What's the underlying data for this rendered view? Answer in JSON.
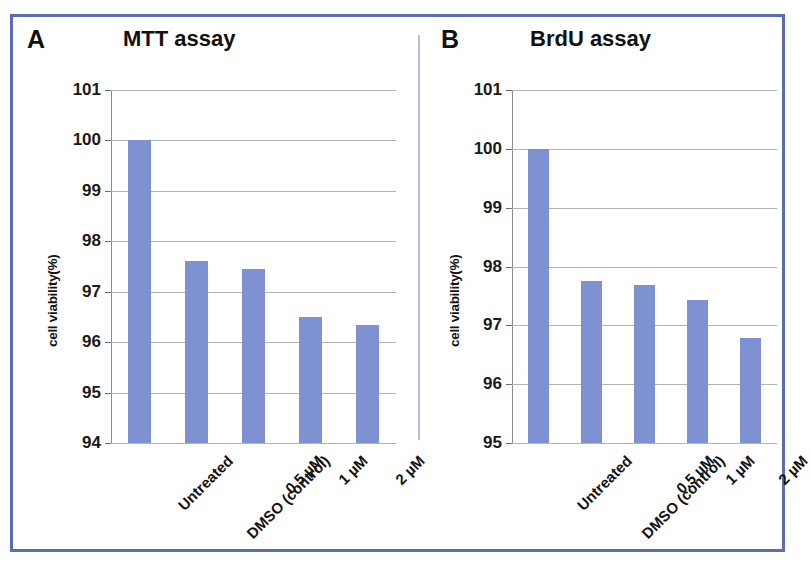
{
  "figure": {
    "border_color": "#5b6cb5",
    "bar_color": "#7e91d0",
    "background": "#ffffff"
  },
  "panels": [
    {
      "letter": "A",
      "title": "MTT assay",
      "y_axis_title": "cell viability(%)"
    },
    {
      "letter": "B",
      "title": "BrdU assay",
      "y_axis_title": "cell viability(%)"
    }
  ],
  "categories": [
    "Untreated",
    "DMSO (control)",
    "0.5 µM",
    "1 µM",
    "2 µM"
  ],
  "y_ticks_a": [
    "101",
    "100",
    "99",
    "98",
    "97",
    "96",
    "95",
    "94"
  ],
  "y_ticks_b": [
    "101",
    "100",
    "99",
    "98",
    "97",
    "96",
    "95"
  ],
  "chart_data": [
    {
      "type": "bar",
      "title": "MTT assay",
      "panel": "A",
      "categories": [
        "Untreated",
        "DMSO (control)",
        "0.5 µM",
        "1 µM",
        "2 µM"
      ],
      "values": [
        100.0,
        97.6,
        97.45,
        96.5,
        96.35
      ],
      "xlabel": "",
      "ylabel": "cell viability(%)",
      "ylim": [
        94,
        101
      ],
      "yticks": [
        94,
        95,
        96,
        97,
        98,
        99,
        100,
        101
      ],
      "grid": true,
      "legend": false,
      "bar_color": "#7e91d0"
    },
    {
      "type": "bar",
      "title": "BrdU assay",
      "panel": "B",
      "categories": [
        "Untreated",
        "DMSO (control)",
        "0.5 µM",
        "1 µM",
        "2 µM"
      ],
      "values": [
        100.0,
        97.75,
        97.68,
        97.43,
        96.78
      ],
      "xlabel": "",
      "ylabel": "cell viability(%)",
      "ylim": [
        95,
        101
      ],
      "yticks": [
        95,
        96,
        97,
        98,
        99,
        100,
        101
      ],
      "grid": true,
      "legend": false,
      "bar_color": "#7e91d0"
    }
  ]
}
